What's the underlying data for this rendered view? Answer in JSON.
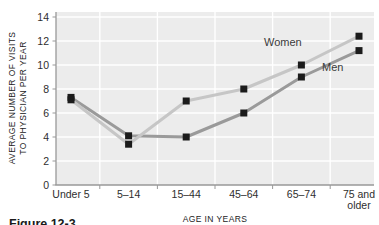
{
  "figure": {
    "caption": "Figure 12-3"
  },
  "chart_data": {
    "type": "line",
    "title": "",
    "xlabel": "AGE IN YEARS",
    "ylabel_lines": [
      "AVERAGE NUMBER OF VISITS",
      "TO PHYSICIAN PER YEAR"
    ],
    "categories": [
      "Under 5",
      "5–14",
      "15–44",
      "45–64",
      "65–74",
      "75 and older"
    ],
    "x_tick_lines": [
      [
        "Under 5"
      ],
      [
        "5–14"
      ],
      [
        "15–44"
      ],
      [
        "45–64"
      ],
      [
        "65–74"
      ],
      [
        "75 and",
        "older"
      ]
    ],
    "yticks": [
      0,
      2,
      4,
      6,
      8,
      10,
      12,
      14
    ],
    "ylim": [
      0,
      14
    ],
    "grid": true,
    "legend_position": "inline-labels-on-lines",
    "series": [
      {
        "name": "Women",
        "values": [
          7.1,
          3.4,
          7.0,
          8.0,
          10.0,
          12.4
        ],
        "color": "#c6c6c6"
      },
      {
        "name": "Men",
        "values": [
          7.3,
          4.1,
          4.0,
          6.0,
          9.0,
          11.2
        ],
        "color": "#9a9a9a"
      }
    ],
    "marker": {
      "shape": "square",
      "color": "#1b1b1b",
      "size": 7
    }
  },
  "colors": {
    "plot_background": "#ececec",
    "gridline": "#ffffff",
    "spine": "#999999",
    "page_background": "#ffffff"
  }
}
